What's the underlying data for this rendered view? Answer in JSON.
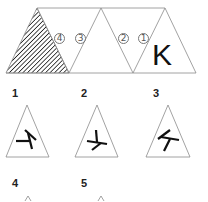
{
  "strip": {
    "faces": [
      {
        "id": "hatched",
        "fill": "hatched"
      },
      {
        "id": "4",
        "label": "④"
      },
      {
        "id": "3",
        "label": "③"
      },
      {
        "id": "2",
        "label": "②"
      },
      {
        "id": "1",
        "label": "①"
      },
      {
        "id": "K",
        "letter": "K"
      }
    ],
    "labels": {
      "c4": "4",
      "c3": "3",
      "c2": "2",
      "c1": "1"
    },
    "letter": "K"
  },
  "options": [
    {
      "number": "1",
      "glyph": "rotated-K"
    },
    {
      "number": "2",
      "glyph": "rotated-K"
    },
    {
      "number": "3",
      "glyph": "rotated-K"
    },
    {
      "number": "4",
      "glyph": "partial"
    },
    {
      "number": "5",
      "glyph": "partial"
    }
  ],
  "colors": {
    "stroke": "#8a8a8a",
    "ink": "#111111",
    "hatch": "#222222"
  }
}
